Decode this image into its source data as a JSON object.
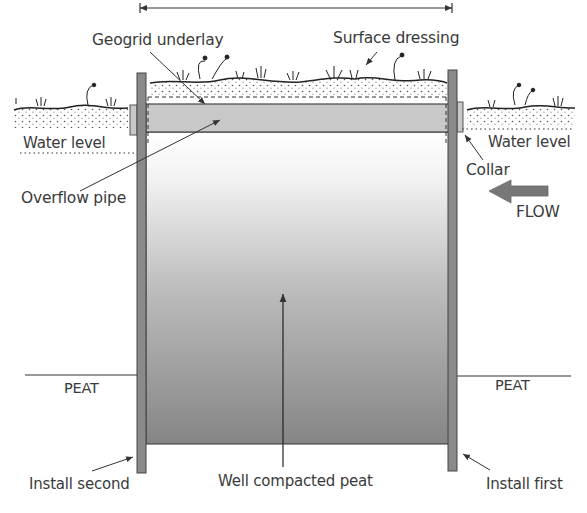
{
  "diagram": {
    "type": "cross-section",
    "labels": {
      "geogrid_underlay": "Geogrid underlay",
      "surface_dressing": "Surface dressing",
      "water_level_left": "Water level",
      "water_level_right": "Water level",
      "overflow_pipe": "Overflow pipe",
      "collar": "Collar",
      "flow": "FLOW",
      "peat_left": "PEAT",
      "peat_right": "PEAT",
      "install_second": "Install second",
      "well_compacted_peat": "Well compacted peat",
      "install_first": "Install first"
    },
    "colors": {
      "post": "#8a8a8a",
      "post_border": "#444444",
      "pipe_fill": "#c8c8c8",
      "fill_top": "#ffffff",
      "fill_bottom": "#858585",
      "flow_arrow": "#777777",
      "line": "#333333"
    }
  }
}
